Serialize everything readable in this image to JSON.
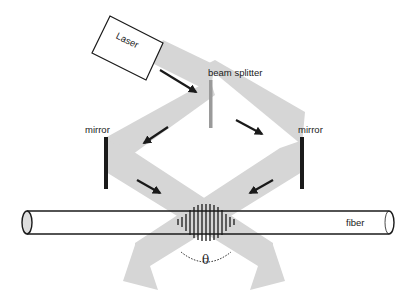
{
  "diagram": {
    "labels": {
      "laser": "Laser",
      "beam_splitter": "beam splitter",
      "mirror_left": "mirror",
      "mirror_right": "mirror",
      "fiber": "fiber",
      "angle": "θ"
    },
    "components": [
      {
        "id": "laser",
        "type": "light-source",
        "label": "Laser"
      },
      {
        "id": "beam_splitter",
        "type": "beam-splitter",
        "label": "beam splitter"
      },
      {
        "id": "mirror_left",
        "type": "mirror",
        "label": "mirror"
      },
      {
        "id": "mirror_right",
        "type": "mirror",
        "label": "mirror"
      },
      {
        "id": "fiber",
        "type": "optical-fiber",
        "label": "fiber"
      },
      {
        "id": "fringes",
        "type": "interference-pattern",
        "label": ""
      },
      {
        "id": "angle",
        "type": "angle-marker",
        "label": "θ"
      }
    ],
    "connections": [
      {
        "from": "laser",
        "to": "beam_splitter",
        "kind": "beam"
      },
      {
        "from": "beam_splitter",
        "to": "mirror_left",
        "kind": "beam"
      },
      {
        "from": "beam_splitter",
        "to": "mirror_right",
        "kind": "beam"
      },
      {
        "from": "mirror_left",
        "to": "fringes",
        "kind": "beam"
      },
      {
        "from": "mirror_right",
        "to": "fringes",
        "kind": "beam"
      }
    ],
    "colors": {
      "beam": "#d6d6d6",
      "stroke": "#1a1a1a",
      "splitter": "#9a9a9a",
      "fiber_end": "#dedede",
      "background": "#ffffff"
    }
  }
}
